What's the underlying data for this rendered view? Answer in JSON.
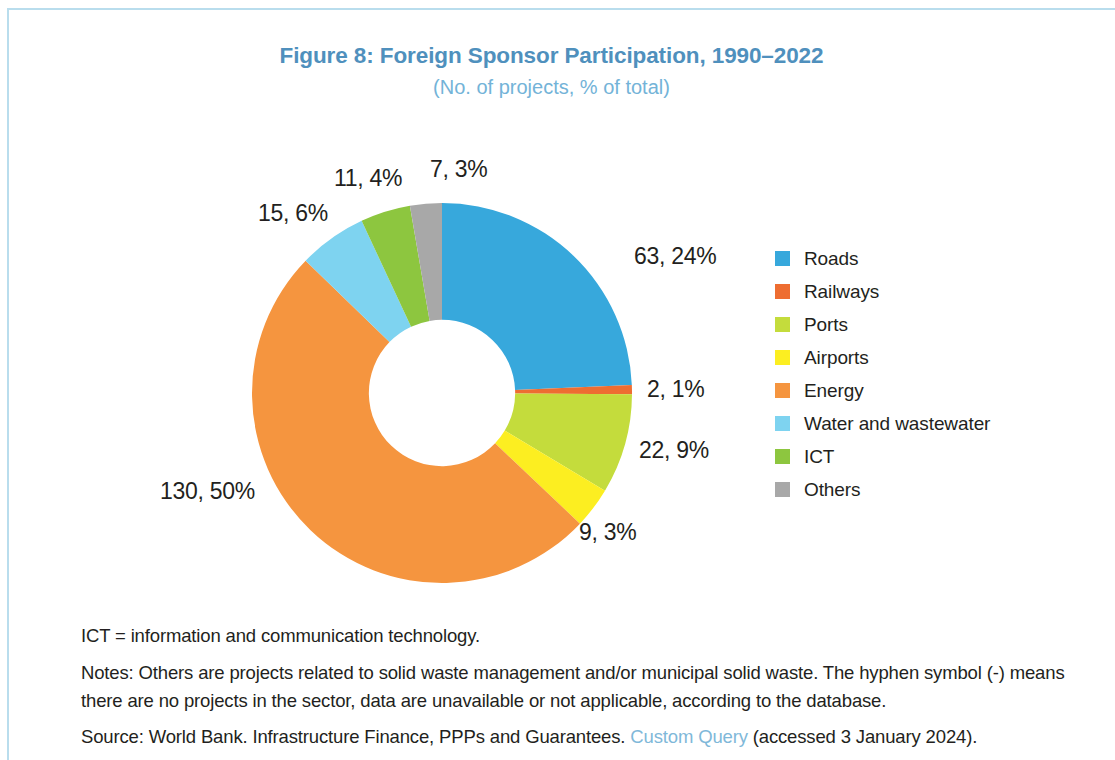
{
  "figure": {
    "title": "Figure 8: Foreign Sponsor Participation, 1990–2022",
    "subtitle": "(No. of projects, % of total)",
    "title_color": "#4f90bd",
    "subtitle_color": "#73b3d8",
    "frame_color": "#b9dded"
  },
  "chart_data": {
    "type": "pie",
    "variant": "donut",
    "title": "Figure 8: Foreign Sponsor Participation, 1990–2022",
    "subtitle": "(No. of projects, % of total)",
    "unit": "No. of projects, % of total",
    "total": 259,
    "start_angle_deg": 0,
    "direction": "clockwise",
    "inner_radius_ratio": 0.385,
    "legend_position": "right",
    "categories": [
      "Roads",
      "Railways",
      "Ports",
      "Airports",
      "Energy",
      "Water and wastewater",
      "ICT",
      "Others"
    ],
    "values": [
      63,
      2,
      22,
      9,
      130,
      15,
      11,
      7
    ],
    "percents": [
      24,
      1,
      9,
      3,
      50,
      6,
      4,
      3
    ],
    "colors": [
      "#37a8dc",
      "#ee6d31",
      "#c4dc3c",
      "#fcee21",
      "#f5953f",
      "#7ed3f0",
      "#8dc63f",
      "#a8a8a8"
    ],
    "data_labels": [
      "63, 24%",
      "2, 1%",
      "22, 9%",
      "9, 3%",
      "130, 50%",
      "15, 6%",
      "11, 4%",
      "7, 3%"
    ]
  },
  "labels": {
    "roads": "63, 24%",
    "railways": "2, 1%",
    "ports": "22, 9%",
    "airports": "9, 3%",
    "energy": "130, 50%",
    "water": "15, 6%",
    "ict": "11, 4%",
    "others": "7, 3%"
  },
  "legend": {
    "items": [
      {
        "label": "Roads",
        "color": "#37a8dc"
      },
      {
        "label": "Railways",
        "color": "#ee6d31"
      },
      {
        "label": "Ports",
        "color": "#c4dc3c"
      },
      {
        "label": "Airports",
        "color": "#fcee21"
      },
      {
        "label": "Energy",
        "color": "#f5953f"
      },
      {
        "label": "Water and wastewater",
        "color": "#7ed3f0"
      },
      {
        "label": "ICT",
        "color": "#8dc63f"
      },
      {
        "label": "Others",
        "color": "#a8a8a8"
      }
    ]
  },
  "footnotes": {
    "abbreviation": "ICT = information and communication technology.",
    "notes": "Notes: Others are projects related to solid waste management and/or municipal solid waste. The hyphen symbol (-) means there are no projects in the sector, data are unavailable or not applicable, according to the database.",
    "source_prefix": "Source: World Bank. Infrastructure Finance, PPPs and Guarantees. ",
    "source_link": "Custom Query",
    "source_suffix": " (accessed 3 January 2024)."
  }
}
